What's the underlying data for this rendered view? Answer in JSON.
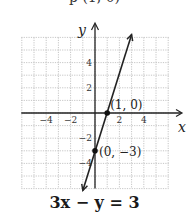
{
  "top_cut_text": "p (1, 0)",
  "chart_data": {
    "type": "line",
    "title": "",
    "caption": "3x − y = 3",
    "xlabel": "x",
    "ylabel": "y",
    "xlim": [
      -6,
      6
    ],
    "ylim": [
      -6,
      6
    ],
    "grid": true,
    "x_ticks": [
      -4,
      -2,
      2,
      4
    ],
    "y_ticks": [
      4,
      2,
      -2,
      -4
    ],
    "x_tick_labels": [
      "−4",
      "−2",
      "2",
      "4"
    ],
    "y_tick_labels": [
      "4",
      "2",
      "−2",
      "−4"
    ],
    "series": [
      {
        "name": "3x − y = 3",
        "equation": "y = 3x − 3",
        "x": [
          -1,
          3
        ],
        "y": [
          -6,
          6
        ]
      }
    ],
    "points": [
      {
        "x": 1,
        "y": 0,
        "label": "(1, 0)"
      },
      {
        "x": 0,
        "y": -3,
        "label": "(0, −3)"
      }
    ]
  }
}
